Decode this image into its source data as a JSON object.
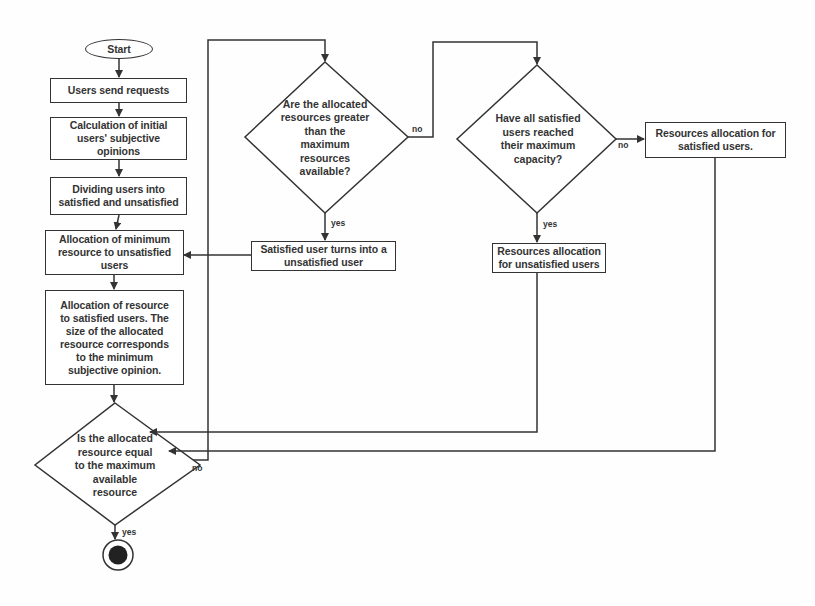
{
  "flowchart": {
    "start": "Start",
    "steps": {
      "users_send_requests": "Users send requests",
      "calc_opinions": "Calculation of initial users' subjective opinions",
      "dividing_users": "Dividing users into satisfied and unsatisfied",
      "alloc_min_unsatisfied": "Allocation of minimum resource to unsatisfied users",
      "alloc_satisfied": "Allocation of resource to satisfied users. The size of the allocated resource corresponds to the minimum subjective opinion.",
      "satisfied_turns_unsatisfied": "Satisfied user turns into a unsatisfied user",
      "resources_alloc_unsatisfied": "Resources allocation for unsatisfied users",
      "resources_alloc_satisfied": "Resources allocation for satisfied users."
    },
    "decisions": {
      "equal_max": "Is the allocated resource equal to the maximum available resource",
      "greater_max": "Are the allocated resources greater than the maximum resources available?",
      "all_satisfied_max": "Have all satisfied users reached their maximum capacity?"
    },
    "edge_labels": {
      "equal_max_yes": "yes",
      "equal_max_no": "no",
      "greater_max_yes": "yes",
      "greater_max_no": "no",
      "all_satisfied_yes": "yes",
      "all_satisfied_no": "no"
    },
    "colors": {
      "line": "#333333",
      "background": "#fefefe",
      "end_dot": "#222222"
    }
  }
}
